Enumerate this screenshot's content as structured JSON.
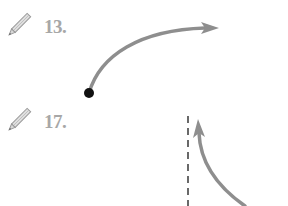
{
  "exercises": [
    {
      "number": "13.",
      "icon": "pencil-icon"
    },
    {
      "number": "17.",
      "icon": "pencil-icon"
    }
  ],
  "figures": {
    "fig13": {
      "description": "curved arrow starting at black dot, ending with arrowhead pointing right",
      "curve_color": "#8e8e8e",
      "dot_color": "#111111"
    },
    "fig17": {
      "description": "vertical dashed line with curved arrow pointing upward alongside it",
      "curve_color": "#8e8e8e",
      "dash_color": "#444444"
    }
  }
}
